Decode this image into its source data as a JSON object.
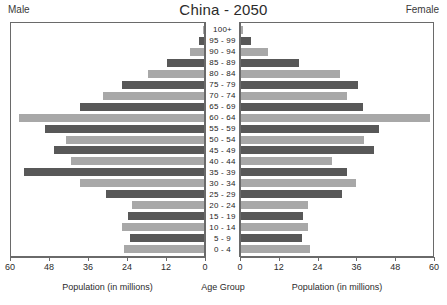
{
  "header": {
    "title": "China - 2050",
    "left_label": "Male",
    "right_label": "Female"
  },
  "captions": {
    "left": "Population (in millions)",
    "center": "Age Group",
    "right": "Population (in millions)"
  },
  "colors": {
    "bar_dark": "#585858",
    "bar_light": "#a8a8a8",
    "axis": "#6a6a6a",
    "background": "#ffffff",
    "text": "#1d1d1d"
  },
  "chart_data": {
    "type": "bar",
    "title": "China - 2050",
    "subtitle": "",
    "orientation": "horizontal",
    "layout": "population-pyramid",
    "xlabel": "Population (in millions)",
    "ylabel": "Age Group",
    "xlim": [
      0,
      60
    ],
    "grid": false,
    "legend": [
      "Male",
      "Female"
    ],
    "legend_position": "top-corners",
    "axis_ticks": [
      0,
      12,
      24,
      36,
      48,
      60
    ],
    "left_axis_ticks": [
      60,
      48,
      36,
      24,
      12,
      0
    ],
    "right_axis_ticks": [
      0,
      12,
      24,
      36,
      48,
      60
    ],
    "categories": [
      "100+",
      "95 - 99",
      "90 - 94",
      "85 - 89",
      "80 - 84",
      "75 - 79",
      "70 - 74",
      "65 - 69",
      "60 - 64",
      "55 - 59",
      "50 - 54",
      "45 - 49",
      "40 - 44",
      "35 - 39",
      "30 - 34",
      "25 - 29",
      "20 - 24",
      "15 - 19",
      "10 - 14",
      "5 - 9",
      "0 - 4"
    ],
    "series": [
      {
        "name": "Male",
        "side": "left",
        "values": [
          0.3,
          1.5,
          4.5,
          11.5,
          17.5,
          25.5,
          31.5,
          38.5,
          57.5,
          49.5,
          43.0,
          46.5,
          41.5,
          56.0,
          38.5,
          30.5,
          22.5,
          23.5,
          25.5,
          23.0,
          25.0
        ]
      },
      {
        "name": "Female",
        "side": "right",
        "values": [
          0.5,
          3.0,
          8.5,
          18.0,
          31.0,
          36.5,
          33.0,
          38.0,
          59.0,
          43.0,
          38.5,
          41.5,
          28.5,
          33.0,
          36.0,
          31.5,
          21.0,
          19.5,
          21.0,
          19.0,
          21.5
        ]
      }
    ]
  }
}
